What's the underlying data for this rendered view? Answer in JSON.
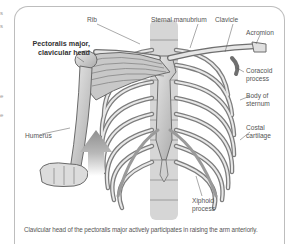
{
  "figure": {
    "labels": {
      "rib": "Rib",
      "sternal_manubrium": "Sternal manubrium",
      "clavicle": "Clavicle",
      "acromion": "Acromion",
      "pectoralis_line1": "Pectoralis major,",
      "pectoralis_line2": "clavicular head",
      "coracoid_line1": "Coracoid",
      "coracoid_line2": "process",
      "body_sternum_line1": "Body of",
      "body_sternum_line2": "sternum",
      "costal_line1": "Costal",
      "costal_line2": "cartilage",
      "humerus": "Humerus",
      "xiphoid_line1": "Xiphoid",
      "xiphoid_line2": "process"
    },
    "caption": "Clavicular head of the pectoralis major actively participates in raising the arm anteriorly.",
    "arrow_direction": "up",
    "colors": {
      "border": "#bdbdbd",
      "bone": "#d9d9d9",
      "muscle": "#c4c4c4",
      "arrow": "#9e9e9e"
    }
  },
  "margin_fragments": [
    "s",
    "s",
    "",
    "e",
    "e"
  ]
}
